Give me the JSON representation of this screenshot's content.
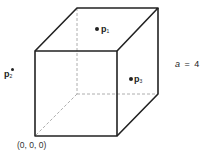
{
  "diagram": {
    "type": "cube",
    "edge_length_label": {
      "var": "a",
      "eq": "=",
      "value": "4"
    },
    "origin_label": "(0, 0, 0)",
    "points": [
      {
        "name": "p",
        "sub": "1",
        "location": "on top face"
      },
      {
        "name": "p",
        "sub": "2",
        "location": "outside cube, left"
      },
      {
        "name": "p",
        "sub": "3",
        "location": "on right face"
      }
    ],
    "colors": {
      "line": "#222222",
      "dashed": "#888888",
      "background": "#ffffff"
    }
  }
}
